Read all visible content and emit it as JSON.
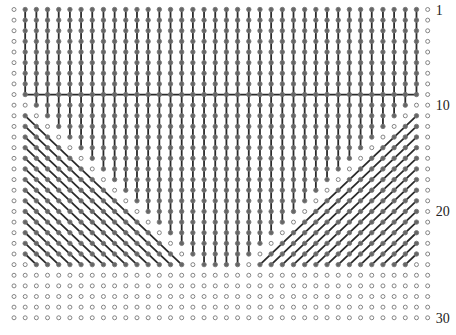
{
  "diagram": {
    "type": "pin-grid-wiring",
    "columns": 38,
    "rows": 30,
    "origin_x": 14,
    "origin_y": 9.5,
    "col_spacing": 11.18,
    "row_spacing": 10.63,
    "bus_row": 9,
    "bus_from_col": 1,
    "bus_to_col": 36,
    "last_row_of_lines": 25,
    "diagonal_count": 14,
    "colors": {
      "line": "#2a2a2a",
      "pin_open": "#777777",
      "pin_filled": "#666666"
    },
    "row_labels": [
      {
        "row": 1,
        "text": "1"
      },
      {
        "row": 10,
        "text": "10"
      },
      {
        "row": 20,
        "text": "20"
      },
      {
        "row": 30,
        "text": "30"
      }
    ]
  }
}
